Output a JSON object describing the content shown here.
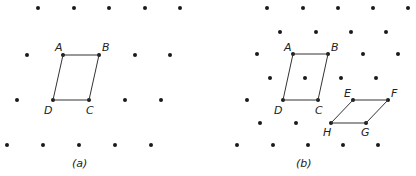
{
  "panels": {
    "a": {
      "caption": "(a)",
      "points": {
        "A": "A",
        "B": "B",
        "C": "C",
        "D": "D"
      }
    },
    "b": {
      "caption": "(b)",
      "points": {
        "A": "A",
        "B": "B",
        "C": "C",
        "D": "D",
        "E": "E",
        "F": "F",
        "G": "G",
        "H": "H"
      }
    }
  },
  "colors": {
    "dot": "#1a1a1a",
    "line": "#333333"
  }
}
